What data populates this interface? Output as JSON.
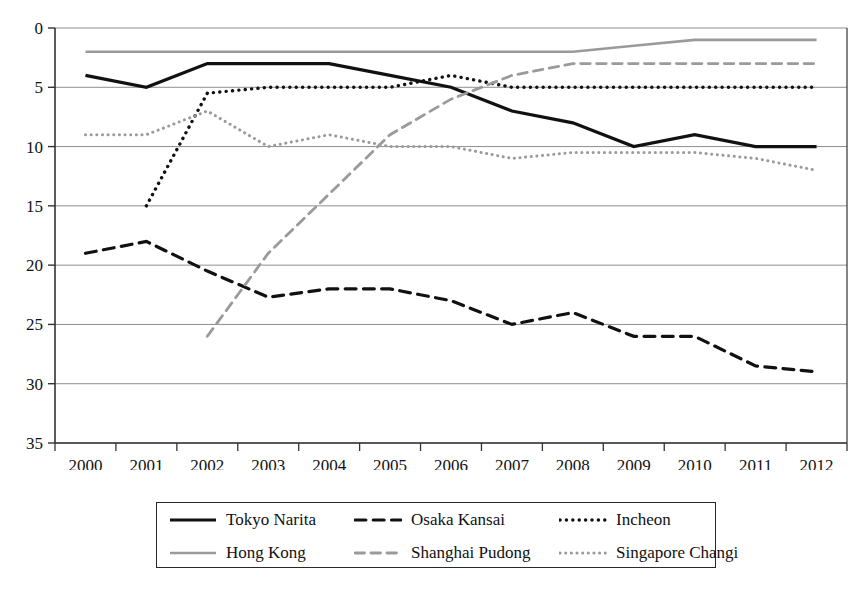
{
  "chart_data": {
    "type": "line",
    "title": "",
    "subtitle": "",
    "xlabel": "",
    "ylabel": "",
    "x": [
      "2000",
      "2001",
      "2002",
      "2003",
      "2004",
      "2005",
      "2006",
      "2007",
      "2008",
      "2009",
      "2010",
      "2011",
      "2012"
    ],
    "categories": [
      "2000",
      "2001",
      "2002",
      "2003",
      "2004",
      "2005",
      "2006",
      "2007",
      "2008",
      "2009",
      "2010",
      "2011",
      "2012"
    ],
    "ylim": [
      0,
      35
    ],
    "y_inverted": true,
    "y_ticks": [
      0,
      5,
      10,
      15,
      20,
      25,
      30,
      35
    ],
    "grid": "horizontal",
    "legend_position": "bottom",
    "series": [
      {
        "name": "Tokyo Narita",
        "style": "solid",
        "color": "#111111",
        "width": 3.2,
        "values": [
          4,
          5,
          3,
          3,
          3,
          4,
          5,
          7,
          8,
          10,
          9,
          10,
          10
        ]
      },
      {
        "name": "Osaka Kansai",
        "style": "dashed",
        "color": "#111111",
        "width": 3.2,
        "values": [
          19,
          18,
          20.5,
          22.7,
          22,
          22,
          23,
          25,
          24,
          26,
          26,
          28.5,
          29
        ]
      },
      {
        "name": "Incheon",
        "style": "dotted",
        "color": "#111111",
        "width": 3.4,
        "values": [
          null,
          15,
          5.5,
          5,
          5,
          5,
          4,
          5,
          5,
          5,
          5,
          5,
          5
        ]
      },
      {
        "name": "Hong Kong",
        "style": "solid",
        "color": "#9a9a9a",
        "width": 2.6,
        "values": [
          2,
          2,
          2,
          2,
          2,
          2,
          2,
          2,
          2,
          1.5,
          1,
          1,
          1
        ]
      },
      {
        "name": "Shanghai Pudong",
        "style": "dashed",
        "color": "#9a9a9a",
        "width": 2.8,
        "values": [
          null,
          null,
          26,
          19,
          14,
          9,
          6,
          4,
          3,
          3,
          3,
          3,
          3
        ]
      },
      {
        "name": "Singapore Changi",
        "style": "dotted",
        "color": "#9a9a9a",
        "width": 3.0,
        "values": [
          9,
          9,
          7,
          10,
          9,
          10,
          10,
          11,
          10.5,
          10.5,
          10.5,
          11,
          12
        ]
      }
    ]
  },
  "legend": {
    "entries": [
      {
        "label": "Tokyo Narita"
      },
      {
        "label": "Osaka Kansai"
      },
      {
        "label": "Incheon"
      },
      {
        "label": "Hong Kong"
      },
      {
        "label": "Shanghai Pudong"
      },
      {
        "label": "Singapore Changi"
      }
    ]
  }
}
